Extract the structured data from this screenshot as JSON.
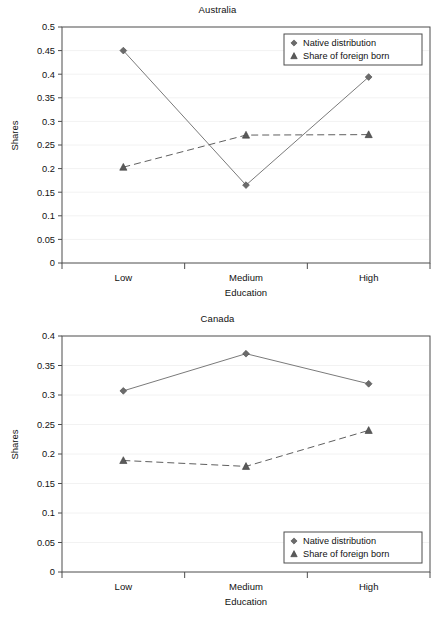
{
  "chart_data": [
    {
      "type": "line",
      "title": "Australia",
      "xlabel": "Education",
      "ylabel": "Shares",
      "categories": [
        "Low",
        "Medium",
        "High"
      ],
      "ylim": [
        0,
        0.5
      ],
      "ytick_labels": [
        "0",
        "0.05",
        "0.1",
        "0.15",
        "0.2",
        "0.25",
        "0.3",
        "0.35",
        "0.4",
        "0.45",
        "0.5"
      ],
      "ytick_values": [
        0,
        0.05,
        0.1,
        0.15,
        0.2,
        0.25,
        0.3,
        0.35,
        0.4,
        0.45,
        0.5
      ],
      "grid": true,
      "legend_position": "top-right",
      "series": [
        {
          "name": "Native distribution",
          "marker": "diamond",
          "linestyle": "solid",
          "color": "#7a7a7a",
          "values": [
            0.45,
            0.165,
            0.394
          ]
        },
        {
          "name": "Share of foreign born",
          "marker": "triangle",
          "linestyle": "dashed",
          "color": "#5f5f5f",
          "values": [
            0.203,
            0.271,
            0.272
          ]
        }
      ]
    },
    {
      "type": "line",
      "title": "Canada",
      "xlabel": "Education",
      "ylabel": "Shares",
      "categories": [
        "Low",
        "Medium",
        "High"
      ],
      "ylim": [
        0,
        0.4
      ],
      "ytick_labels": [
        "0",
        "0.05",
        "0.1",
        "0.15",
        "0.2",
        "0.25",
        "0.3",
        "0.35",
        "0.4"
      ],
      "ytick_values": [
        0,
        0.05,
        0.1,
        0.15,
        0.2,
        0.25,
        0.3,
        0.35,
        0.4
      ],
      "grid": true,
      "legend_position": "bottom-right",
      "series": [
        {
          "name": "Native distribution",
          "marker": "diamond",
          "linestyle": "solid",
          "color": "#7a7a7a",
          "values": [
            0.307,
            0.37,
            0.319
          ]
        },
        {
          "name": "Share of foreign born",
          "marker": "triangle",
          "linestyle": "dashed",
          "color": "#5f5f5f",
          "values": [
            0.189,
            0.179,
            0.24
          ]
        }
      ]
    }
  ]
}
